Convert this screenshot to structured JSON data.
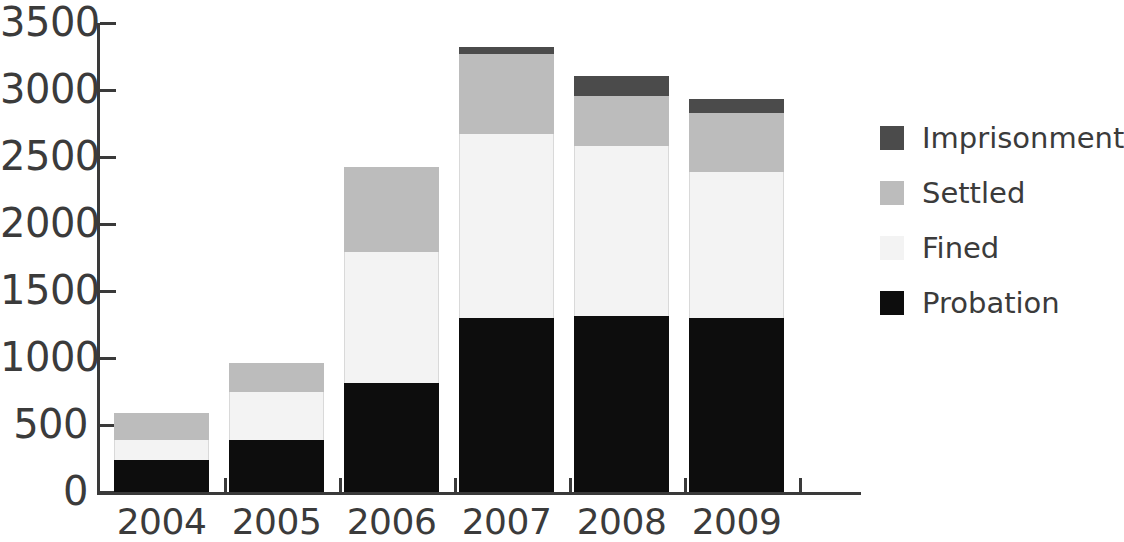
{
  "chart_data": {
    "type": "bar",
    "stacked": true,
    "title": "",
    "subtitle": "",
    "xlabel": "",
    "ylabel": "",
    "categories": [
      "2004",
      "2005",
      "2006",
      "2007",
      "2008",
      "2009"
    ],
    "series": [
      {
        "name": "Probation",
        "color": "#0d0d0d",
        "values": [
          240,
          390,
          815,
          1300,
          1315,
          1300
        ]
      },
      {
        "name": "Fined",
        "color": "#f3f3f3",
        "values": [
          150,
          360,
          975,
          1370,
          1270,
          1090
        ]
      },
      {
        "name": "Settled",
        "color": "#bcbcbc",
        "values": [
          200,
          210,
          635,
          600,
          370,
          440
        ]
      },
      {
        "name": "Imprisonment",
        "color": "#4b4b4b",
        "values": [
          0,
          0,
          0,
          50,
          150,
          100
        ]
      }
    ],
    "stack_order_bottom_to_top": [
      "Probation",
      "Fined",
      "Settled",
      "Imprisonment"
    ],
    "totals": [
      590,
      960,
      2425,
      3320,
      3105,
      2930
    ],
    "ylim": [
      0,
      3500
    ],
    "y_ticks": [
      "0",
      "500",
      "1000",
      "1500",
      "2000",
      "2500",
      "3000",
      "3500"
    ],
    "y_tick_values": [
      0,
      500,
      1000,
      1500,
      2000,
      2500,
      3000,
      3500
    ],
    "grid": false,
    "legend_position": "right",
    "legend_entries": [
      {
        "label": "Imprisonment",
        "color": "#4b4b4b"
      },
      {
        "label": "Settled",
        "color": "#bcbcbc"
      },
      {
        "label": "Fined",
        "color": "#f3f3f3"
      },
      {
        "label": "Probation",
        "color": "#0d0d0d"
      }
    ]
  }
}
